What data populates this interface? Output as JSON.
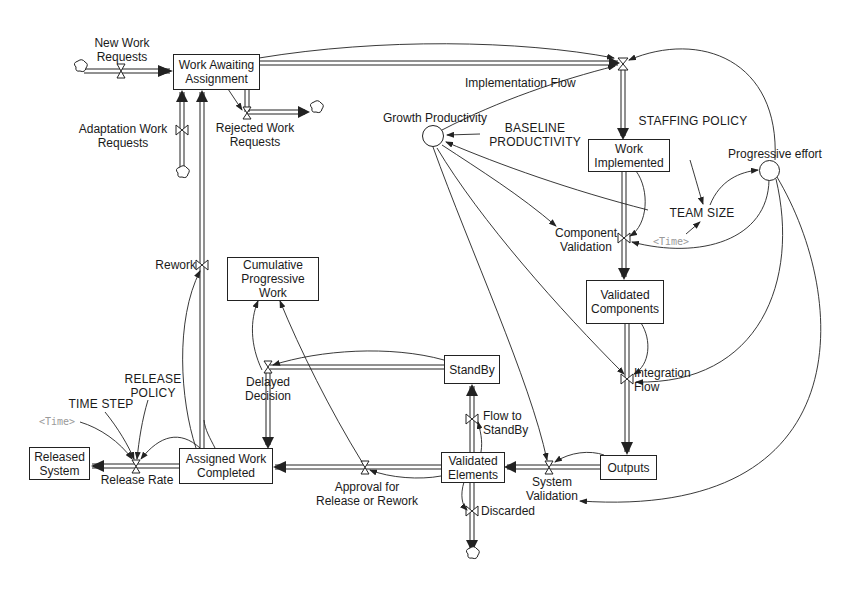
{
  "diagram": {
    "type": "system-dynamics-stock-and-flow",
    "stocks": {
      "work_awaiting_assignment": "Work Awaiting\nAssignment",
      "work_implemented": "Work\nImplemented",
      "validated_components": "Validated\nComponents",
      "outputs": "Outputs",
      "validated_elements": "Validated\nElements",
      "standby": "StandBy",
      "cumulative_progressive_work": "Cumulative\nProgressive\nWork",
      "assigned_work_completed": "Assigned Work\nCompleted",
      "released_system": "Released\nSystem"
    },
    "flows": {
      "new_work_requests": "New Work\nRequests",
      "adaptation_work_requests": "Adaptation Work\nRequests",
      "rejected_work_requests": "Rejected Work\nRequests",
      "implementation_flow": "Implementation Flow",
      "component_validation": "Component\nValidation",
      "integration_flow": "Integration\nFlow",
      "system_validation": "System\nValidation",
      "flow_to_standby": "Flow to\nStandBy",
      "discarded": "Discarded",
      "delayed_decision": "Delayed\nDecision",
      "approval_for_release_or_rework": "Approval for\nRelease or Rework",
      "rework": "Rework",
      "release_rate": "Release Rate"
    },
    "auxiliaries": {
      "growth_productivity": "Growth Productivity",
      "progressive_effort": "Progressive effort"
    },
    "constants": {
      "baseline_productivity": "BASELINE\nPRODUCTIVITY",
      "staffing_policy": "STAFFING POLICY",
      "team_size": "TEAM SIZE",
      "release_policy": "RELEASE\nPOLICY",
      "time_step": "TIME STEP"
    },
    "shadow_variables": {
      "time_right": "<Time>",
      "time_left": "<Time>"
    },
    "colors": {
      "line": "#222222",
      "shadow_text": "#9a9a9a",
      "background": "#ffffff"
    }
  }
}
